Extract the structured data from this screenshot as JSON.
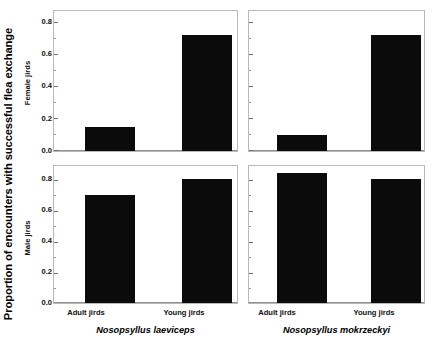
{
  "figure": {
    "ylabel": "Proportion of encounters with successful flea exchange"
  },
  "chart_data": {
    "type": "bar",
    "title": "",
    "xlabel": "",
    "ylabel": "Proportion of encounters with successful flea exchange",
    "ylim": [
      0.0,
      0.9
    ],
    "yticks": [
      0.0,
      0.2,
      0.4,
      0.6,
      0.8
    ],
    "ytick_labels": [
      "0.0",
      "0.2",
      "0.4",
      "0.6",
      "0.8"
    ],
    "minor_yticks": [
      0.1,
      0.3,
      0.5,
      0.7
    ],
    "grid": false,
    "legend": "none",
    "bar_color": "#0b0b0b",
    "categories": [
      "Adult jirds",
      "Young jirds"
    ],
    "column_labels": [
      "Nosopsyllus laeviceps",
      "Nosopsyllus mokrzeckyi"
    ],
    "row_labels": [
      "Female jirds",
      "Male jirds"
    ],
    "panels": [
      {
        "row": "Female jirds",
        "column": "Nosopsyllus laeviceps",
        "show_ytick_labels": true,
        "categories": [
          "Adult jirds",
          "Young jirds"
        ],
        "values": [
          0.15,
          0.72
        ]
      },
      {
        "row": "Female jirds",
        "column": "Nosopsyllus mokrzeckyi",
        "show_ytick_labels": false,
        "categories": [
          "Adult jirds",
          "Young jirds"
        ],
        "values": [
          0.1,
          0.72
        ]
      },
      {
        "row": "Male jirds",
        "column": "Nosopsyllus laeviceps",
        "show_ytick_labels": true,
        "categories": [
          "Adult jirds",
          "Young jirds"
        ],
        "values": [
          0.7,
          0.8
        ]
      },
      {
        "row": "Male jirds",
        "column": "Nosopsyllus mokrzeckyi",
        "show_ytick_labels": false,
        "categories": [
          "Adult jirds",
          "Young jirds"
        ],
        "values": [
          0.84,
          0.8
        ]
      }
    ]
  }
}
